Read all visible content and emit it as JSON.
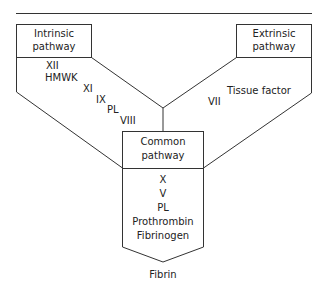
{
  "diagram": {
    "type": "coagulation-cascade",
    "line_color": "#333333",
    "text_color": "#222222",
    "intrinsic": {
      "title_line1": "Intrinsic",
      "title_line2": "pathway",
      "factors": [
        "XII",
        "HMWK",
        "XI",
        "IX",
        "PL",
        "VIII"
      ]
    },
    "extrinsic": {
      "title_line1": "Extrinsic",
      "title_line2": "pathway",
      "factors": [
        "VII",
        "Tissue factor"
      ]
    },
    "common": {
      "title_line1": "Common",
      "title_line2": "pathway",
      "factors": [
        "X",
        "V",
        "PL",
        "Prothrombin",
        "Fibrinogen"
      ]
    },
    "product": "Fibrin"
  }
}
